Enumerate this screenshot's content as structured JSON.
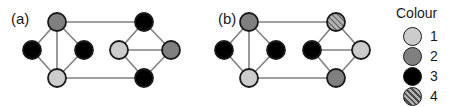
{
  "figure": {
    "panels": [
      {
        "label": "(a)",
        "label_x": 11,
        "label_y": 11,
        "nodes": [
          {
            "id": "a-l-top",
            "x": 57,
            "y": 22,
            "colour": 2
          },
          {
            "id": "a-l-left",
            "x": 32,
            "y": 50,
            "colour": 3
          },
          {
            "id": "a-l-right",
            "x": 84,
            "y": 50,
            "colour": 3
          },
          {
            "id": "a-l-bottom",
            "x": 57,
            "y": 78,
            "colour": 1
          },
          {
            "id": "a-r-top",
            "x": 144,
            "y": 22,
            "colour": 3
          },
          {
            "id": "a-r-left",
            "x": 119,
            "y": 50,
            "colour": 1
          },
          {
            "id": "a-r-right",
            "x": 171,
            "y": 50,
            "colour": 2
          },
          {
            "id": "a-r-bottom",
            "x": 144,
            "y": 78,
            "colour": 3
          }
        ],
        "edges": [
          [
            "a-l-top",
            "a-l-left"
          ],
          [
            "a-l-top",
            "a-l-right"
          ],
          [
            "a-l-top",
            "a-l-bottom"
          ],
          [
            "a-l-left",
            "a-l-bottom"
          ],
          [
            "a-l-right",
            "a-l-bottom"
          ],
          [
            "a-r-top",
            "a-r-left"
          ],
          [
            "a-r-top",
            "a-r-right"
          ],
          [
            "a-r-left",
            "a-r-right"
          ],
          [
            "a-r-left",
            "a-r-bottom"
          ],
          [
            "a-r-right",
            "a-r-bottom"
          ],
          [
            "a-l-top",
            "a-r-top"
          ],
          [
            "a-l-bottom",
            "a-r-bottom"
          ]
        ]
      },
      {
        "label": "(b)",
        "label_x": 218,
        "label_y": 11,
        "nodes": [
          {
            "id": "b-l-top",
            "x": 249,
            "y": 22,
            "colour": 2
          },
          {
            "id": "b-l-left",
            "x": 224,
            "y": 50,
            "colour": 3
          },
          {
            "id": "b-l-right",
            "x": 276,
            "y": 50,
            "colour": 3
          },
          {
            "id": "b-l-bottom",
            "x": 249,
            "y": 78,
            "colour": 1
          },
          {
            "id": "b-r-top",
            "x": 336,
            "y": 22,
            "colour": 4
          },
          {
            "id": "b-r-left",
            "x": 312,
            "y": 50,
            "colour": 3
          },
          {
            "id": "b-r-right",
            "x": 361,
            "y": 50,
            "colour": 1
          },
          {
            "id": "b-r-bottom",
            "x": 336,
            "y": 78,
            "colour": 2
          }
        ],
        "edges": [
          [
            "b-l-top",
            "b-l-left"
          ],
          [
            "b-l-top",
            "b-l-right"
          ],
          [
            "b-l-top",
            "b-l-bottom"
          ],
          [
            "b-l-left",
            "b-l-bottom"
          ],
          [
            "b-l-right",
            "b-l-bottom"
          ],
          [
            "b-r-top",
            "b-r-left"
          ],
          [
            "b-r-top",
            "b-r-right"
          ],
          [
            "b-r-left",
            "b-r-right"
          ],
          [
            "b-r-left",
            "b-r-bottom"
          ],
          [
            "b-r-right",
            "b-r-bottom"
          ],
          [
            "b-l-top",
            "b-r-top"
          ],
          [
            "b-l-bottom",
            "b-r-bottom"
          ]
        ]
      }
    ],
    "node_radius": 9,
    "node_stroke": "#1a1a1a",
    "edge_stroke": "#808080"
  },
  "legend": {
    "title": "Colour",
    "items": [
      {
        "label": "1",
        "colour": 1,
        "fill": "#cccccc"
      },
      {
        "label": "2",
        "colour": 2,
        "fill": "#808080"
      },
      {
        "label": "3",
        "colour": 3,
        "fill": "#000000"
      },
      {
        "label": "4",
        "colour": 4,
        "fill": "#b3b3b3"
      }
    ]
  },
  "palette": {
    "colour1": "#cccccc",
    "colour2": "#808080",
    "colour3": "#000000",
    "colour4_base": "#b3b3b3",
    "colour4_hatch": "#4d4d4d",
    "outline": "#1a1a1a",
    "edge": "#808080",
    "background": "#ffffff"
  }
}
